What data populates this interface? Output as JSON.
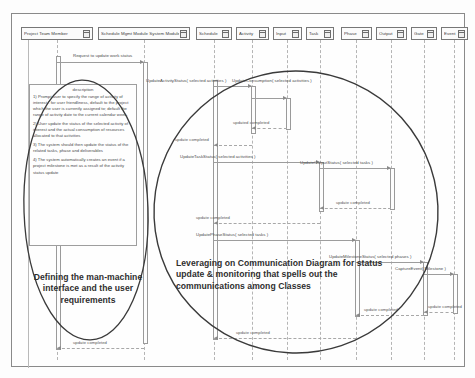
{
  "diagram": {
    "lifelines": [
      {
        "name": "Project Team Member",
        "icon": "object-icon"
      },
      {
        "name": "Schedule Mgmt Module System Module",
        "icon": "object-icon"
      },
      {
        "name": "Schedule",
        "icon": "object-icon"
      },
      {
        "name": "Activity",
        "icon": "object-icon"
      },
      {
        "name": "Input",
        "icon": "object-icon"
      },
      {
        "name": "Task",
        "icon": "object-icon"
      },
      {
        "name": "Phase",
        "icon": "object-icon"
      },
      {
        "name": "Output",
        "icon": "object-icon"
      },
      {
        "name": "Gate",
        "icon": "object-icon"
      },
      {
        "name": "Event",
        "icon": "object-icon"
      }
    ],
    "messages": [
      {
        "label": "Request to update work status"
      },
      {
        "label": "UpdateActivityStatus( selected activities )"
      },
      {
        "label": "UpdateConsumption( selected activities )"
      },
      {
        "label": "updated completed"
      },
      {
        "label": "update completed"
      },
      {
        "label": "UpdateTaskStatus( selected activities )"
      },
      {
        "label": "UpdateOutputStatus( selected tasks )"
      },
      {
        "label": "update completed"
      },
      {
        "label": "update completed"
      },
      {
        "label": "UpdatePhaseStatus( selected tasks )"
      },
      {
        "label": "UpdateMilestoneStatus( selected phases )"
      },
      {
        "label": "CaptureEvent( Milestone )"
      },
      {
        "label": "update completed"
      },
      {
        "label": "update completed"
      },
      {
        "label": "update completed"
      },
      {
        "label": "update completed"
      }
    ],
    "note": {
      "title": "description",
      "lines": [
        "1) Prompt user to specify the range of activity of interest - for user friendliness, default to the project which the user is currently assigned to; default the range of activity date to the current calendar week.",
        "2) User update the status of the selected activity of interest and the actual consumption of resources allocated to that activities",
        "3) The system should then update the status of the related tasks, phase and deliverables",
        "4) The system automatically creates an event if a project milestone is met as a result of the activity status update"
      ]
    },
    "annotations": {
      "left": "Defining the man-machine interface and the user requirements",
      "right": "Leveraging on Communication Diagram for status update  & monitoring that spells out  the communications among Classes"
    },
    "colors": {
      "line": "#9d9d9d",
      "border": "#777777",
      "ink": "#3a3a3a",
      "text": "#4a4a4a"
    }
  }
}
